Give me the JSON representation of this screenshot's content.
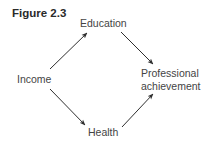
{
  "figure": {
    "title": "Figure 2.3"
  },
  "nodes": {
    "income": "Income",
    "education": "Education",
    "health": "Health",
    "professional_line1": "Professional",
    "professional_line2": "achievement"
  },
  "edges": [
    {
      "from": "Income",
      "to": "Education"
    },
    {
      "from": "Education",
      "to": "Professional achievement"
    },
    {
      "from": "Income",
      "to": "Health"
    },
    {
      "from": "Health",
      "to": "Professional achievement"
    }
  ],
  "colors": {
    "text": "#444444",
    "arrow": "#2f2f2f",
    "background": "#ffffff"
  }
}
